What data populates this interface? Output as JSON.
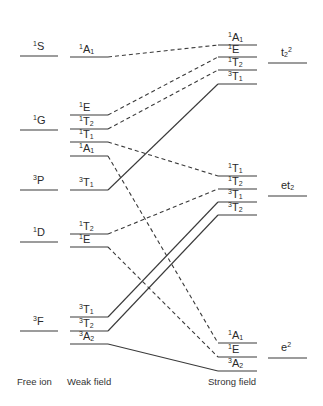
{
  "diagram": {
    "columns": {
      "free_ion": "Free ion",
      "weak_field": "Weak field",
      "strong_field": "Strong field"
    },
    "free_ion_terms": [
      {
        "term": "1S",
        "sup": "1",
        "main": "S",
        "y": 56
      },
      {
        "term": "1G",
        "sup": "1",
        "main": "G",
        "y": 130
      },
      {
        "term": "3P",
        "sup": "3",
        "main": "P",
        "y": 190
      },
      {
        "term": "1D",
        "sup": "1",
        "main": "D",
        "y": 242
      },
      {
        "term": "3F",
        "sup": "3",
        "main": "F",
        "y": 331
      }
    ],
    "weak_field_states": [
      {
        "sup": "1",
        "main": "A",
        "sub": "1",
        "y": 57
      },
      {
        "sup": "1",
        "main": "E",
        "sub": "",
        "y": 115
      },
      {
        "sup": "1",
        "main": "T",
        "sub": "2",
        "y": 129
      },
      {
        "sup": "1",
        "main": "T",
        "sub": "1",
        "y": 142
      },
      {
        "sup": "1",
        "main": "A",
        "sub": "1",
        "y": 156
      },
      {
        "sup": "3",
        "main": "T",
        "sub": "1",
        "y": 190
      },
      {
        "sup": "1",
        "main": "T",
        "sub": "2",
        "y": 234
      },
      {
        "sup": "1",
        "main": "E",
        "sub": "",
        "y": 247
      },
      {
        "sup": "3",
        "main": "T",
        "sub": "1",
        "y": 317
      },
      {
        "sup": "3",
        "main": "T",
        "sub": "2",
        "y": 331
      },
      {
        "sup": "3",
        "main": "A",
        "sub": "2",
        "y": 344
      }
    ],
    "strong_field_states": [
      {
        "sup": "1",
        "main": "A",
        "sub": "1",
        "y": 45
      },
      {
        "sup": "1",
        "main": "E",
        "sub": "",
        "y": 57
      },
      {
        "sup": "1",
        "main": "T",
        "sub": "2",
        "y": 70
      },
      {
        "sup": "3",
        "main": "T",
        "sub": "1",
        "y": 84
      },
      {
        "sup": "1",
        "main": "T",
        "sub": "1",
        "y": 176
      },
      {
        "sup": "1",
        "main": "T",
        "sub": "2",
        "y": 189
      },
      {
        "sup": "3",
        "main": "T",
        "sub": "1",
        "y": 202
      },
      {
        "sup": "3",
        "main": "T",
        "sub": "2",
        "y": 215
      },
      {
        "sup": "1",
        "main": "A",
        "sub": "1",
        "y": 343
      },
      {
        "sup": "1",
        "main": "E",
        "sub": "",
        "y": 357
      },
      {
        "sup": "3",
        "main": "A",
        "sub": "2",
        "y": 371
      }
    ],
    "configurations": [
      {
        "label": "t2^2",
        "main": "t",
        "sub": "2",
        "sup": "2",
        "y": 63
      },
      {
        "label": "et2",
        "main": "et",
        "sub": "2",
        "sup": "",
        "y": 196
      },
      {
        "label": "e^2",
        "main": "e",
        "sub": "",
        "sup": "2",
        "y": 358
      }
    ],
    "correlations": [
      {
        "from": 0,
        "to": 0,
        "style": "dashed"
      },
      {
        "from": 1,
        "to": 1,
        "style": "dashed"
      },
      {
        "from": 2,
        "to": 2,
        "style": "dashed"
      },
      {
        "from": 3,
        "to": 4,
        "style": "dashed"
      },
      {
        "from": 4,
        "to": 8,
        "style": "dashed"
      },
      {
        "from": 5,
        "to": 3,
        "style": "solid"
      },
      {
        "from": 6,
        "to": 5,
        "style": "dashed"
      },
      {
        "from": 7,
        "to": 9,
        "style": "dashed"
      },
      {
        "from": 8,
        "to": 6,
        "style": "solid"
      },
      {
        "from": 9,
        "to": 7,
        "style": "solid"
      },
      {
        "from": 10,
        "to": 10,
        "style": "solid"
      }
    ],
    "colors": {
      "line": "#3a3a3a",
      "text": "#2a2a2a"
    }
  }
}
